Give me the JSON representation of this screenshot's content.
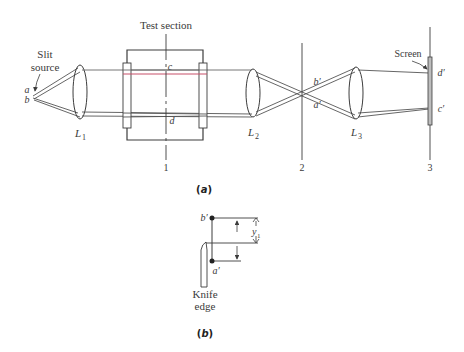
{
  "figure": {
    "part_a": {
      "caption": "(a)",
      "caption_letter": "a",
      "labels": {
        "test_section": "Test section",
        "slit": "Slit",
        "source": "source",
        "point_a": "a",
        "point_b": "b",
        "point_c": "c",
        "point_d": "d",
        "point_b_prime": "b′",
        "point_a_prime": "a′",
        "point_d_prime": "d′",
        "point_c_prime": "c′",
        "screen": "Screen",
        "lens_1": "L",
        "lens_1_sub": "1",
        "lens_2": "L",
        "lens_2_sub": "2",
        "lens_3": "L",
        "lens_3_sub": "3",
        "plane_1": "1",
        "plane_2": "2",
        "plane_3": "3"
      },
      "colors": {
        "line": "#3c3c3c",
        "ray_green": "#3cb371",
        "ray_red": "#d8405a",
        "ray_blue": "#4a6fb0"
      }
    },
    "part_b": {
      "caption": "(b)",
      "caption_letter": "b",
      "labels": {
        "point_b_prime": "b′",
        "point_a_prime": "a′",
        "displacement": "y",
        "displacement_sub": "1",
        "knife": "Knife",
        "edge": "edge"
      }
    }
  }
}
